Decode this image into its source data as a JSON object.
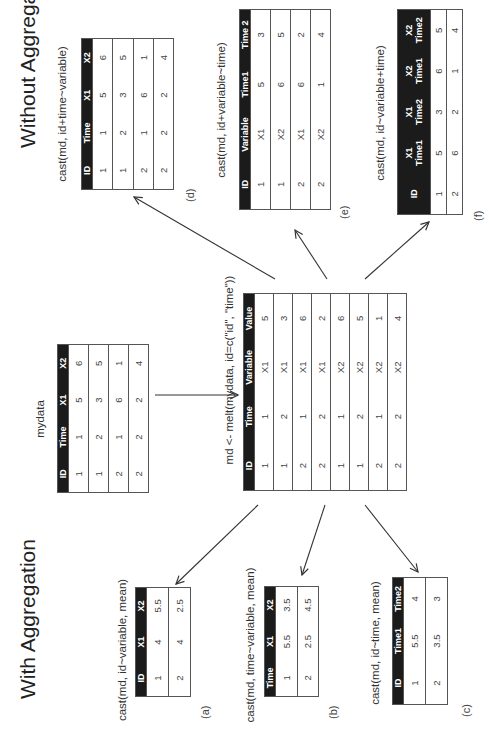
{
  "titles": {
    "without": "Without Aggregation",
    "with": "With Aggregation"
  },
  "mydata": {
    "caption": "mydata",
    "headers": [
      "ID",
      "Time",
      "X1",
      "X2"
    ],
    "rows": [
      [
        "1",
        "1",
        "5",
        "6"
      ],
      [
        "1",
        "2",
        "3",
        "5"
      ],
      [
        "2",
        "1",
        "6",
        "1"
      ],
      [
        "2",
        "2",
        "2",
        "4"
      ]
    ]
  },
  "melt": {
    "caption": "md <- melt(mydata, id=c(\"id\", \"time\"))",
    "headers": [
      "ID",
      "Time",
      "Variable",
      "Value"
    ],
    "rows": [
      [
        "1",
        "1",
        "X1",
        "5"
      ],
      [
        "1",
        "2",
        "X1",
        "3"
      ],
      [
        "2",
        "1",
        "X1",
        "6"
      ],
      [
        "2",
        "2",
        "X1",
        "2"
      ],
      [
        "1",
        "1",
        "X2",
        "6"
      ],
      [
        "1",
        "2",
        "X2",
        "5"
      ],
      [
        "2",
        "1",
        "X2",
        "1"
      ],
      [
        "2",
        "2",
        "X2",
        "4"
      ]
    ]
  },
  "d": {
    "caption": "cast(md, id+time~variable)",
    "label": "(d)",
    "headers": [
      "ID",
      "Time",
      "X1",
      "X2"
    ],
    "rows": [
      [
        "1",
        "1",
        "5",
        "6"
      ],
      [
        "1",
        "2",
        "3",
        "5"
      ],
      [
        "2",
        "1",
        "6",
        "1"
      ],
      [
        "2",
        "2",
        "2",
        "4"
      ]
    ]
  },
  "e": {
    "caption": "cast(md, id+variable~time)",
    "label": "(e)",
    "headers": [
      "ID",
      "Variable",
      "Time1",
      "Time 2"
    ],
    "rows": [
      [
        "1",
        "X1",
        "5",
        "3"
      ],
      [
        "1",
        "X2",
        "6",
        "5"
      ],
      [
        "2",
        "X1",
        "6",
        "2"
      ],
      [
        "2",
        "X2",
        "1",
        "4"
      ]
    ]
  },
  "f": {
    "caption": "cast(md, id~variable+time)",
    "label": "(f)",
    "headers": [
      [
        "ID",
        ""
      ],
      [
        "X1",
        "Time1"
      ],
      [
        "X1",
        "Time2"
      ],
      [
        "X2",
        "Time1"
      ],
      [
        "X2",
        "Time2"
      ]
    ],
    "rows": [
      [
        "1",
        "5",
        "3",
        "6",
        "5"
      ],
      [
        "2",
        "6",
        "2",
        "1",
        "4"
      ]
    ]
  },
  "a": {
    "caption": "cast(md, id~variable, mean)",
    "label": "(a)",
    "headers": [
      "ID",
      "X1",
      "X2"
    ],
    "rows": [
      [
        "1",
        "4",
        "5.5"
      ],
      [
        "2",
        "4",
        "2.5"
      ]
    ]
  },
  "b": {
    "caption": "cast(md, time~variable, mean)",
    "label": "(b)",
    "headers": [
      "Time",
      "X1",
      "X2"
    ],
    "rows": [
      [
        "1",
        "5.5",
        "3.5"
      ],
      [
        "2",
        "2.5",
        "4.5"
      ]
    ]
  },
  "c": {
    "caption": "cast(md, id~time, mean)",
    "label": "(c)",
    "headers": [
      "ID",
      "Time1",
      "Time2"
    ],
    "rows": [
      [
        "1",
        "5.5",
        "4"
      ],
      [
        "2",
        "3.5",
        "3"
      ]
    ]
  },
  "colors": {
    "header_bg": "#1b1b1b",
    "header_fg": "#ffffff",
    "border": "#555555",
    "arrow": "#333333"
  }
}
